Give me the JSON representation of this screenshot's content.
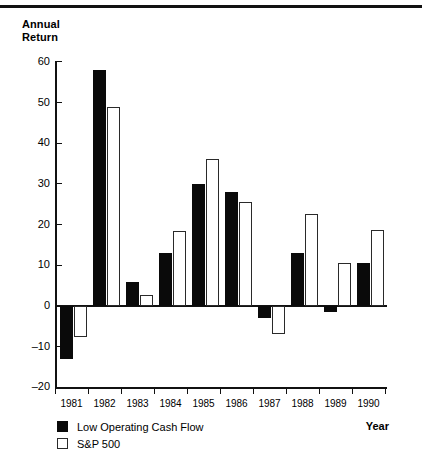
{
  "figure": {
    "top_rule": true,
    "y_axis_title": "Annual\nReturn",
    "x_axis_title": "Year"
  },
  "legend": {
    "position": "below-axis-left",
    "entries": [
      {
        "label": "Low Operating Cash Flow",
        "swatch": "filled-black-square",
        "color": "#0a0a0a"
      },
      {
        "label": "S&P 500",
        "swatch": "hollow-white-square",
        "color": "#ffffff"
      }
    ]
  },
  "chart_data": {
    "type": "bar",
    "title": "",
    "subtitle": "",
    "xlabel": "Year",
    "ylabel": "Annual Return",
    "categories": [
      "1981",
      "1982",
      "1983",
      "1984",
      "1985",
      "1986",
      "1987",
      "1988",
      "1989",
      "1990"
    ],
    "series": [
      {
        "name": "Low Operating Cash Flow",
        "color": "#0a0a0a",
        "values": [
          -13.0,
          58.0,
          6.0,
          13.0,
          30.0,
          28.0,
          -3.0,
          13.0,
          -1.5,
          10.5
        ]
      },
      {
        "name": "S&P 500",
        "color": "#ffffff",
        "values": [
          -7.5,
          49.0,
          2.7,
          18.5,
          36.0,
          25.5,
          -7.0,
          22.7,
          10.5,
          18.6
        ]
      }
    ],
    "ylim": [
      -20,
      60
    ],
    "yticks": [
      -20,
      -10,
      0,
      10,
      20,
      30,
      40,
      50,
      60
    ],
    "ytick_labels": [
      "–20",
      "–10",
      "0",
      "10",
      "20",
      "30",
      "40",
      "50",
      "60"
    ],
    "xtick_labels": [
      "1981",
      "1982",
      "1983",
      "1984",
      "1985",
      "1986",
      "1987",
      "1988",
      "1989",
      "1990"
    ],
    "grid": false,
    "zero_line": true,
    "legend_position": "bottom-left",
    "bar_group_order": [
      "Low Operating Cash Flow",
      "S&P 500"
    ]
  }
}
